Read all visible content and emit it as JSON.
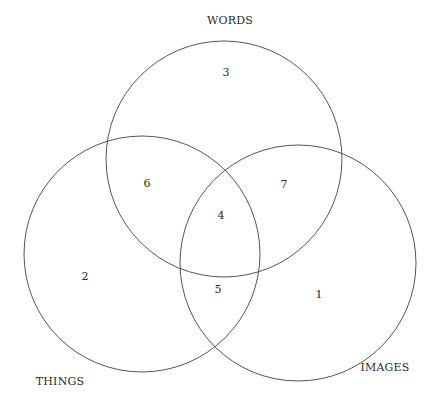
{
  "diagram": {
    "type": "venn-3",
    "stroke_color": "#555555",
    "sets": [
      {
        "name": "WORDS",
        "cx": 224,
        "cy": 159,
        "r": 118,
        "label_x": 230,
        "label_y": 24
      },
      {
        "name": "THINGS",
        "cx": 142,
        "cy": 254,
        "r": 118,
        "label_x": 60,
        "label_y": 385
      },
      {
        "name": "IMAGES",
        "cx": 298,
        "cy": 263,
        "r": 118,
        "label_x": 385,
        "label_y": 371
      }
    ],
    "regions": [
      {
        "number": "1",
        "meaning": "IMAGES only",
        "x": 319,
        "y": 298
      },
      {
        "number": "2",
        "meaning": "THINGS only",
        "x": 85,
        "y": 280
      },
      {
        "number": "3",
        "meaning": "WORDS only",
        "x": 226,
        "y": 76
      },
      {
        "number": "4",
        "meaning": "WORDS ∩ THINGS ∩ IMAGES",
        "x": 221,
        "y": 219
      },
      {
        "number": "5",
        "meaning": "THINGS ∩ IMAGES",
        "x": 218,
        "y": 293
      },
      {
        "number": "6",
        "meaning": "WORDS ∩ THINGS",
        "x": 147,
        "y": 187
      },
      {
        "number": "7",
        "meaning": "WORDS ∩ IMAGES",
        "x": 284,
        "y": 188
      }
    ]
  }
}
